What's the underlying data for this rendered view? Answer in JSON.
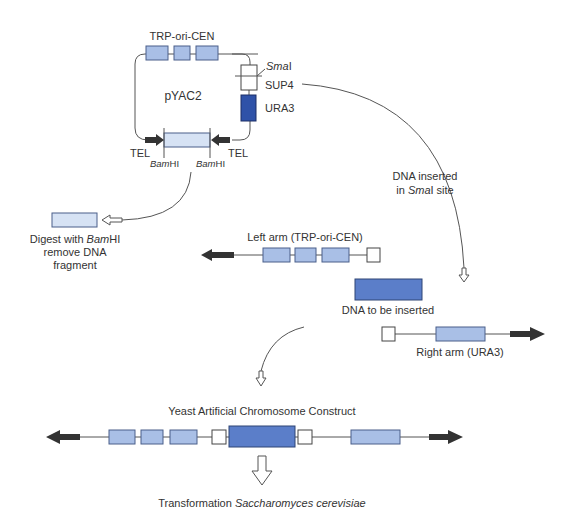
{
  "plasmid": {
    "name": "pYAC2",
    "top_label": "TRP-ori-CEN",
    "smai_label_italic": "Sma",
    "smai_label_suffix": "I",
    "sup4_label": "SUP4",
    "ura3_label": "URA3",
    "tel_left": "TEL",
    "tel_right": "TEL",
    "bamhi_left_italic": "Bam",
    "bamhi_left_suffix": "HI",
    "bamhi_right_italic": "Bam",
    "bamhi_right_suffix": "HI"
  },
  "digest": {
    "line1_prefix": "Digest with ",
    "line1_italic": "Bam",
    "line1_suffix": "HI",
    "line2": "remove DNA",
    "line3": "fragment"
  },
  "insertion_note": {
    "line1": "DNA inserted",
    "line2_prefix": "in ",
    "line2_italic": "Sma",
    "line2_suffix": "I site"
  },
  "left_arm": {
    "label": "Left arm (TRP-ori-CEN)"
  },
  "insert": {
    "label": "DNA to be inserted"
  },
  "right_arm": {
    "label": "Right arm (URA3)"
  },
  "construct": {
    "title": "Yeast Artificial Chromosome Construct"
  },
  "transformation": {
    "prefix": "Transformation ",
    "organism_italic": "Saccharomyces cerevisiae"
  },
  "colors": {
    "light_block": "#a9bfe6",
    "pale_block": "#d6e2f4",
    "insert_block": "#5b7ec9",
    "ura3_block": "#2f52a8",
    "tel_arrow": "#333333"
  }
}
